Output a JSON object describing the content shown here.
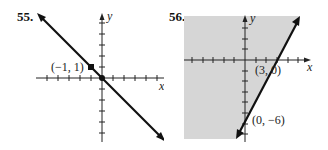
{
  "figures": [
    {
      "number": "55.",
      "x_axis_label": "x",
      "y_axis_label": "y",
      "point_label": "(−1, 1)",
      "line": "y = -x",
      "shading": "none"
    },
    {
      "number": "56.",
      "x_axis_label": "x",
      "y_axis_label": "y",
      "point_labels": [
        "(3, 0)",
        "(0, −6)"
      ],
      "line": "y = 2x - 6",
      "shading": "left of line (y > 2x - 6)",
      "shade_color": "#d6d6d6"
    }
  ],
  "colors": {
    "line": "#111111",
    "axis": "#222222",
    "shade": "#d6d6d6",
    "background": "#ffffff"
  }
}
